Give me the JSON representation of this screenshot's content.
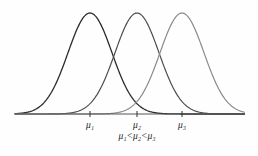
{
  "figure": {
    "background_color": "#fefefe",
    "caption": "μ₁<μ₂<μ₃",
    "axis": {
      "color": "#555555",
      "x_start": 15,
      "x_end": 245,
      "y": 114,
      "tick_color": "#333333",
      "tick_height": 6
    },
    "tick_labels": [
      {
        "text": "μ₁",
        "x": 90
      },
      {
        "text": "μ₂",
        "x": 137
      },
      {
        "text": "μ₃",
        "x": 182
      }
    ]
  },
  "chart_data": {
    "type": "line",
    "title": "",
    "subtitle": "",
    "xlabel": "",
    "ylabel": "",
    "grid": false,
    "legend_position": "none",
    "annotations": [
      "μ₁",
      "μ₂",
      "μ₃",
      "μ₁<μ₂<μ₃"
    ],
    "xlim": [
      15,
      245
    ],
    "ylim": [
      0,
      1
    ],
    "series": [
      {
        "name": "μ₁",
        "mean": 90,
        "sigma": 22,
        "peak_x": 90,
        "peak_y": 13,
        "color": "#2b2b2b",
        "stroke_width": 1.3
      },
      {
        "name": "μ₂",
        "mean": 137,
        "sigma": 22,
        "peak_x": 137,
        "peak_y": 13,
        "color": "#4d4d4d",
        "stroke_width": 1.2
      },
      {
        "name": "μ₃",
        "mean": 182,
        "sigma": 22,
        "peak_x": 182,
        "peak_y": 13,
        "color": "#8a8a8a",
        "stroke_width": 1.2
      }
    ]
  }
}
